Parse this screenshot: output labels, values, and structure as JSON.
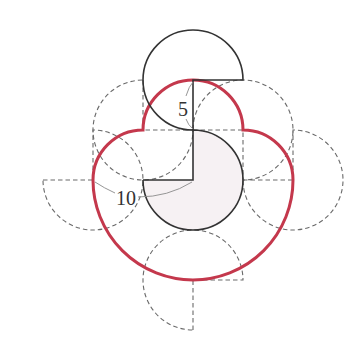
{
  "diagram": {
    "title": "",
    "labels": {
      "small_radius": "5",
      "large_radius": "10"
    },
    "colors": {
      "traced_path": "#c4384c",
      "solid_outline": "#333333",
      "dashed_outline": "#6a6a6a",
      "fixed_fill": "#f6f1f3",
      "leader": "#8a8a8a",
      "background": "#ffffff"
    },
    "fixed_figure": {
      "shape": "three-quarter circle",
      "radius": "5",
      "missing_quadrant": "upper-left",
      "shaded": true
    },
    "rolling_figure_positions": [
      {
        "id": "start",
        "style": "solid",
        "missing_quadrant": "lower-right",
        "location": "top"
      },
      {
        "id": "p2",
        "style": "dashed",
        "missing_quadrant": "upper-right",
        "location": "upper-left"
      },
      {
        "id": "p3",
        "style": "dashed",
        "missing_quadrant": "upper-left",
        "location": "left"
      },
      {
        "id": "p4",
        "style": "dashed",
        "missing_quadrant": "lower-right",
        "location": "bottom"
      },
      {
        "id": "p5",
        "style": "dashed",
        "missing_quadrant": "upper-left",
        "location": "right"
      },
      {
        "id": "p6",
        "style": "dashed",
        "missing_quadrant": "lower-left",
        "location": "upper-right"
      }
    ],
    "traced_path": {
      "description": "locus of the rolling figure's center (red outline)",
      "segments": [
        "arc r=5",
        "arc r=5",
        "arc r=10",
        "arc r=5",
        "arc r=5"
      ]
    }
  }
}
